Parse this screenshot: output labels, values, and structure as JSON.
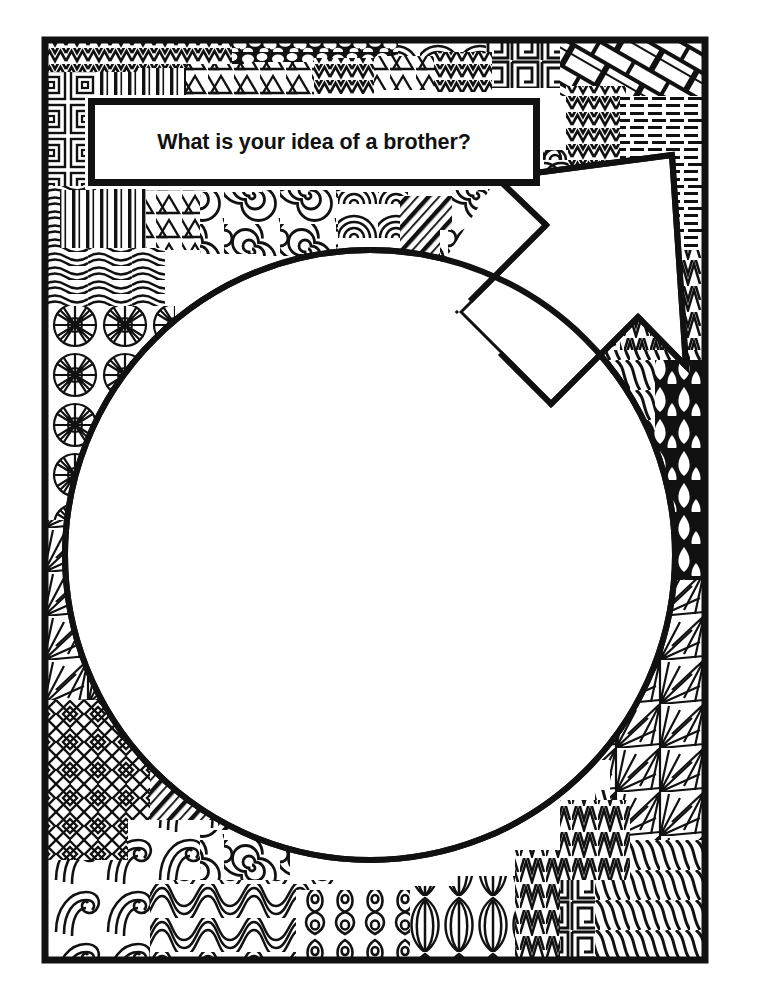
{
  "page": {
    "type": "coloring-worksheet",
    "background_color": "#ffffff",
    "ink_color": "#111111",
    "width": 761,
    "height": 1002
  },
  "prompt": {
    "lead_text": "What is your idea of a ",
    "keyword": "brother",
    "question_mark": "?",
    "full_text": "What is your idea of a brother?"
  },
  "frame": {
    "label": "decorative-zentangle-border",
    "outer": {
      "x": 42,
      "y": 37,
      "width": 666,
      "height": 926
    },
    "stroke_color": "#111111"
  },
  "drawing_area": {
    "label": "male-symbol-blank-area",
    "shape": "circle-with-arrow",
    "circle": {
      "cx": 370,
      "cy": 555,
      "r": 308
    },
    "arrow": {
      "tip_x": 672,
      "tip_y": 155,
      "direction": "upper-right"
    },
    "fill_color": "#ffffff"
  },
  "patterns": [
    {
      "name": "zigzag-chevron",
      "region": "top-left"
    },
    {
      "name": "nested-squares",
      "region": "left-upper"
    },
    {
      "name": "vertical-bars",
      "region": "top-left-inner"
    },
    {
      "name": "triangles",
      "region": "top-left-inner"
    },
    {
      "name": "pebble-cobblestone",
      "region": "top-center"
    },
    {
      "name": "cloud-arcs",
      "region": "top-center-right"
    },
    {
      "name": "angular-maze",
      "region": "top-right-of-center"
    },
    {
      "name": "basket-weave-brick",
      "region": "top-right"
    },
    {
      "name": "zigzag-stack",
      "region": "top-right-lower"
    },
    {
      "name": "comb-lines",
      "region": "right-upper"
    },
    {
      "name": "spiral-swirls",
      "region": "upper-band"
    },
    {
      "name": "wavy-lines",
      "region": "left-middle"
    },
    {
      "name": "sunburst-wheels",
      "region": "left-middle-lower"
    },
    {
      "name": "leaf-petals",
      "region": "arrow-lower-barb"
    },
    {
      "name": "teardrop-paisley",
      "region": "right-edge"
    },
    {
      "name": "radial-fans",
      "region": "right-edge-lower"
    },
    {
      "name": "diamond-chevrons",
      "region": "bottom-left"
    },
    {
      "name": "diagonal-stripes",
      "region": "bottom-left-inner"
    },
    {
      "name": "wave-curl",
      "region": "bottom-left-corner"
    },
    {
      "name": "ribbon-loops",
      "region": "bottom-center-left"
    },
    {
      "name": "bulb-teardrop-loops",
      "region": "bottom-center"
    },
    {
      "name": "onion-lobes",
      "region": "bottom-center-right"
    },
    {
      "name": "zigzag-keys",
      "region": "bottom-right-of-center"
    },
    {
      "name": "zebra-waves",
      "region": "bottom-right-corner"
    }
  ]
}
